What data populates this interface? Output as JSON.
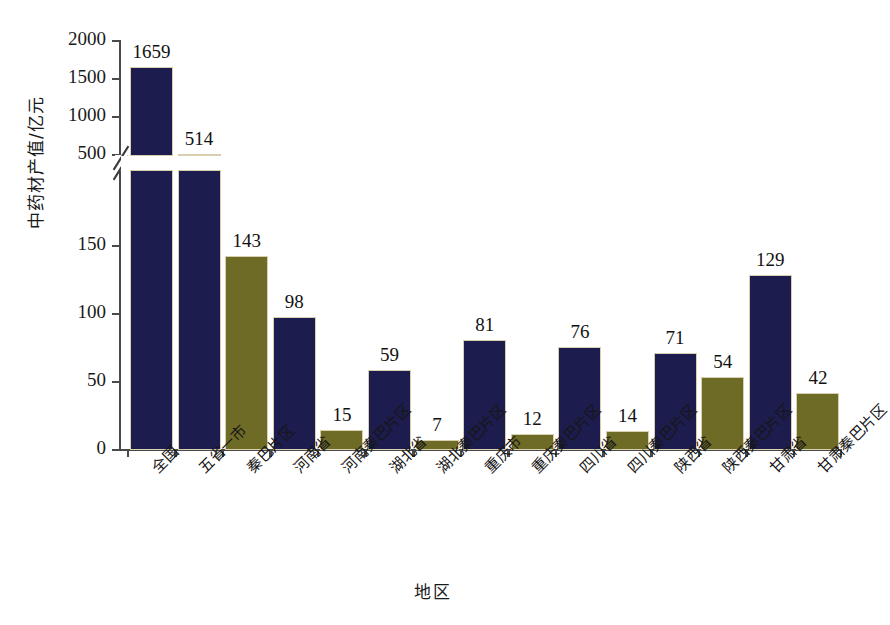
{
  "chart_data": {
    "type": "bar",
    "title": "",
    "xlabel": "地区",
    "ylabel": "中药材产值/亿元",
    "grid": false,
    "legend": "none",
    "broken_axis": true,
    "axis_break_note": "y-axis broken between 150 and 500",
    "lower_ticks": [
      0,
      50,
      100,
      150
    ],
    "upper_ticks": [
      500,
      1000,
      1500,
      2000
    ],
    "lower_ylim": [
      0,
      150
    ],
    "upper_ylim": [
      500,
      2000
    ],
    "categories": [
      "全国",
      "五省一市",
      "秦巴片区",
      "河南省",
      "河南秦巴片区",
      "湖北省",
      "湖北秦巴片区",
      "重庆市",
      "重庆秦巴片区",
      "四川省",
      "四川秦巴片区",
      "陕西省",
      "陕西秦巴片区",
      "甘肃省",
      "甘肃秦巴片区"
    ],
    "values": [
      1659,
      514,
      143,
      98,
      15,
      59,
      7,
      81,
      12,
      76,
      14,
      71,
      54,
      129,
      42
    ],
    "value_labels": [
      "1659",
      "514",
      "143",
      "98",
      "15",
      "59",
      "7",
      "81",
      "12",
      "76",
      "14",
      "71",
      "54",
      "129",
      "42"
    ],
    "series": [
      {
        "name": "产值",
        "values": [
          1659,
          514,
          143,
          98,
          15,
          59,
          7,
          81,
          12,
          76,
          14,
          71,
          54,
          129,
          42
        ]
      }
    ],
    "bar_colors": [
      "navy",
      "navy",
      "olive",
      "navy",
      "olive",
      "navy",
      "olive",
      "navy",
      "olive",
      "navy",
      "olive",
      "navy",
      "olive",
      "navy",
      "olive"
    ],
    "colors": {
      "navy": "#1d1c4e",
      "olive": "#6e6b26",
      "axis": "#4a4a4a",
      "background": "#ffffff",
      "bar_outline": "#d8cfae"
    }
  },
  "axis": {
    "y_tick_labels": [
      "2000",
      "1500",
      "1000",
      "500",
      "150",
      "100",
      "50",
      "0"
    ],
    "y_title": "中药材产值/亿元",
    "x_title": "地区"
  }
}
